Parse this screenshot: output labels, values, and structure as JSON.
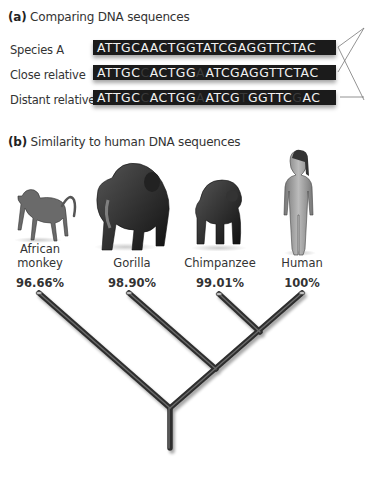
{
  "part_a": {
    "label": "(a)",
    "title": "Comparing DNA sequences",
    "rows": [
      {
        "label": "Species A",
        "segments": [
          {
            "t": "ATTGCAACTGGTATCGAGGTTCTAC",
            "diff": false
          }
        ]
      },
      {
        "label": "Close relative",
        "segments": [
          {
            "t": "ATTGC",
            "diff": false
          },
          {
            "t": "C",
            "diff": true
          },
          {
            "t": "ACTGG",
            "diff": false
          },
          {
            "t": "A",
            "diff": true
          },
          {
            "t": "ATCGAGGTTCTAC",
            "diff": false
          }
        ]
      },
      {
        "label": "Distant relative",
        "segments": [
          {
            "t": "ATTGC",
            "diff": false
          },
          {
            "t": "C",
            "diff": true
          },
          {
            "t": "ACTGG",
            "diff": false
          },
          {
            "t": "A",
            "diff": true
          },
          {
            "t": "ATCG",
            "diff": false
          },
          {
            "t": "T",
            "diff": true
          },
          {
            "t": "GGTTC",
            "diff": false
          },
          {
            "t": "G",
            "diff": true
          },
          {
            "t": "AC",
            "diff": false
          }
        ]
      }
    ]
  },
  "part_b": {
    "label": "(b)",
    "title": "Similarity to human DNA sequences",
    "species": [
      {
        "name_line1": "African",
        "name_line2": "monkey",
        "similarity": "96.66%",
        "icon": "monkey-icon"
      },
      {
        "name_line1": "",
        "name_line2": "Gorilla",
        "similarity": "98.90%",
        "icon": "gorilla-icon"
      },
      {
        "name_line1": "",
        "name_line2": "Chimpanzee",
        "similarity": "99.01%",
        "icon": "chimpanzee-icon"
      },
      {
        "name_line1": "",
        "name_line2": "Human",
        "similarity": "100%",
        "icon": "human-icon"
      }
    ]
  },
  "colors": {
    "bar": "#1b1b1b",
    "bar_text": "#f2f2f2",
    "tree": "#3c3c3c"
  }
}
